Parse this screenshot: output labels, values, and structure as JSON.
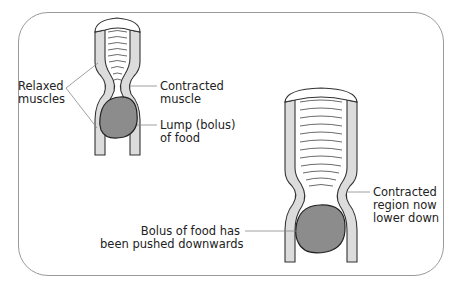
{
  "diagram": {
    "labels": {
      "relaxed_muscles": [
        "Relaxed",
        "muscles"
      ],
      "contracted_muscle": [
        "Contracted",
        "muscle"
      ],
      "lump_of_food": [
        "Lump (bolus)",
        "of food"
      ],
      "contracted_region": [
        "Contracted",
        "region now",
        "lower down"
      ],
      "bolus_pushed": [
        "Bolus of food has",
        "been pushed downwards"
      ]
    },
    "colors": {
      "outline": "#333333",
      "muscle_wall": "#dcdcdc",
      "bolus": "#8c8c8c",
      "frame": "#9a9a9a"
    }
  }
}
